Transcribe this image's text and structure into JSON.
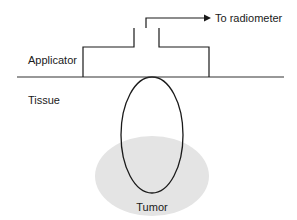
{
  "diagram": {
    "labels": {
      "applicator": "Applicator",
      "tissue": "Tissue",
      "tumor": "Tumor",
      "radiometer": "To radiometer"
    },
    "colors": {
      "stroke": "#1a1a1a",
      "tumor_fill": "#e4e4e4",
      "background": "#ffffff"
    }
  }
}
